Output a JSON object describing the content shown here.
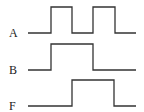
{
  "diagram": {
    "type": "timing-diagram",
    "stroke_color": "#333333",
    "signals": [
      {
        "label": "A",
        "baseline_y": 33,
        "high_y": 7,
        "label_y": 27,
        "x_start": 28,
        "x_end": 136,
        "edges": [
          51,
          72,
          93,
          115
        ],
        "initial": 0
      },
      {
        "label": "B",
        "baseline_y": 70,
        "high_y": 44,
        "label_y": 64,
        "x_start": 28,
        "x_end": 136,
        "edges": [
          51,
          93
        ],
        "initial": 0
      },
      {
        "label": "F",
        "baseline_y": 106,
        "high_y": 80,
        "label_y": 100,
        "x_start": 28,
        "x_end": 136,
        "edges": [
          72,
          114
        ],
        "initial": 0
      }
    ]
  }
}
